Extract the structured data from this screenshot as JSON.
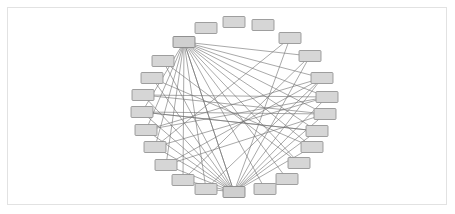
{
  "figure": {
    "background_color": "#ffffff",
    "frame_color": "#e2e2e2",
    "node_fill": "#d6d6d6",
    "node_stroke": "#8a8a8a",
    "edge_color": "#6e6e6e"
  },
  "chart_data": {
    "type": "diagram",
    "layout": "circular",
    "title": "",
    "xlabel": "",
    "ylabel": "",
    "grid": false,
    "legend": null,
    "node_count": 24,
    "edge_count": 48,
    "node_width": 22,
    "node_height": 11,
    "center": [
      234,
      107
    ],
    "radius_x": 88,
    "radius_y": 82,
    "nodes": [
      {
        "id": 0,
        "label": "",
        "cx": 234,
        "cy": 22,
        "hub": false
      },
      {
        "id": 1,
        "label": "",
        "cx": 263,
        "cy": 25,
        "hub": false
      },
      {
        "id": 2,
        "label": "",
        "cx": 290,
        "cy": 38,
        "hub": false
      },
      {
        "id": 3,
        "label": "",
        "cx": 310,
        "cy": 56,
        "hub": false
      },
      {
        "id": 4,
        "label": "",
        "cx": 322,
        "cy": 78,
        "hub": false
      },
      {
        "id": 5,
        "label": "",
        "cx": 327,
        "cy": 97,
        "hub": false
      },
      {
        "id": 6,
        "label": "",
        "cx": 325,
        "cy": 114,
        "hub": false
      },
      {
        "id": 7,
        "label": "",
        "cx": 317,
        "cy": 131,
        "hub": false
      },
      {
        "id": 8,
        "label": "",
        "cx": 312,
        "cy": 147,
        "hub": false
      },
      {
        "id": 9,
        "label": "",
        "cx": 299,
        "cy": 163,
        "hub": false
      },
      {
        "id": 10,
        "label": "",
        "cx": 287,
        "cy": 179,
        "hub": false
      },
      {
        "id": 11,
        "label": "",
        "cx": 265,
        "cy": 189,
        "hub": false
      },
      {
        "id": 12,
        "label": "",
        "cx": 234,
        "cy": 192,
        "hub": true
      },
      {
        "id": 13,
        "label": "",
        "cx": 206,
        "cy": 189,
        "hub": false
      },
      {
        "id": 14,
        "label": "",
        "cx": 183,
        "cy": 180,
        "hub": false
      },
      {
        "id": 15,
        "label": "",
        "cx": 166,
        "cy": 165,
        "hub": false
      },
      {
        "id": 16,
        "label": "",
        "cx": 155,
        "cy": 147,
        "hub": false
      },
      {
        "id": 17,
        "label": "",
        "cx": 146,
        "cy": 130,
        "hub": false
      },
      {
        "id": 18,
        "label": "",
        "cx": 142,
        "cy": 112,
        "hub": false
      },
      {
        "id": 19,
        "label": "",
        "cx": 143,
        "cy": 95,
        "hub": false
      },
      {
        "id": 20,
        "label": "",
        "cx": 152,
        "cy": 78,
        "hub": false
      },
      {
        "id": 21,
        "label": "",
        "cx": 163,
        "cy": 61,
        "hub": false
      },
      {
        "id": 22,
        "label": "",
        "cx": 184,
        "cy": 42,
        "hub": true
      },
      {
        "id": 23,
        "label": "",
        "cx": 206,
        "cy": 28,
        "hub": false
      }
    ],
    "edges": [
      [
        22,
        3
      ],
      [
        22,
        12
      ],
      [
        22,
        11
      ],
      [
        22,
        10
      ],
      [
        22,
        9
      ],
      [
        22,
        8
      ],
      [
        22,
        7
      ],
      [
        22,
        6
      ],
      [
        22,
        5
      ],
      [
        22,
        4
      ],
      [
        22,
        13
      ],
      [
        22,
        14
      ],
      [
        22,
        15
      ],
      [
        22,
        16
      ],
      [
        22,
        17
      ],
      [
        22,
        18
      ],
      [
        12,
        22
      ],
      [
        12,
        21
      ],
      [
        12,
        20
      ],
      [
        12,
        19
      ],
      [
        12,
        18
      ],
      [
        12,
        17
      ],
      [
        12,
        16
      ],
      [
        12,
        15
      ],
      [
        12,
        14
      ],
      [
        12,
        13
      ],
      [
        12,
        2
      ],
      [
        12,
        3
      ],
      [
        12,
        4
      ],
      [
        12,
        5
      ],
      [
        12,
        6
      ],
      [
        12,
        7
      ],
      [
        12,
        8
      ],
      [
        19,
        5
      ],
      [
        19,
        6
      ],
      [
        18,
        6
      ],
      [
        18,
        7
      ],
      [
        17,
        4
      ],
      [
        20,
        8
      ],
      [
        21,
        9
      ],
      [
        16,
        5
      ],
      [
        15,
        4
      ],
      [
        3,
        14
      ],
      [
        2,
        16
      ],
      [
        4,
        13
      ],
      [
        5,
        17
      ],
      [
        6,
        15
      ],
      [
        7,
        18
      ]
    ]
  }
}
